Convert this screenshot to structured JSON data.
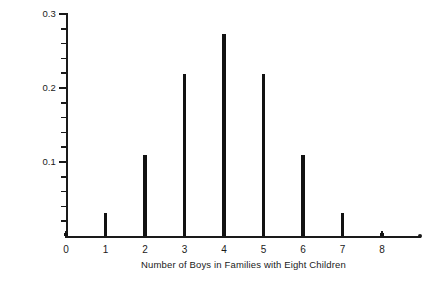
{
  "chart_data": {
    "type": "bar",
    "title": "",
    "subtitle": "",
    "xlabel": "Number of Boys in Families with Eight Children",
    "ylabel": "Probability",
    "categories": [
      "0",
      "1",
      "2",
      "3",
      "4",
      "5",
      "6",
      "7",
      "8"
    ],
    "values": [
      0.004,
      0.031,
      0.109,
      0.219,
      0.273,
      0.219,
      0.109,
      0.031,
      0.004
    ],
    "xlim": [
      0,
      8
    ],
    "ylim": [
      0,
      0.3
    ],
    "y_major_ticks": [
      0.1,
      0.2,
      0.3
    ],
    "y_major_tick_labels": [
      "0.1",
      "0.2",
      "0.3"
    ],
    "y_minor_tick_step": 0.02,
    "x_tick_labels": [
      "0",
      "1",
      "2",
      "3",
      "4",
      "5",
      "6",
      "7",
      "8"
    ],
    "grid": false,
    "legend": null,
    "annotations": [],
    "bar_color": "#121212",
    "axis_color": "#1a1a1a",
    "background_color": "#ffffff"
  },
  "axes": {
    "x_title": "Number of Boys in Families with Eight Children",
    "y_title": "Probability"
  }
}
